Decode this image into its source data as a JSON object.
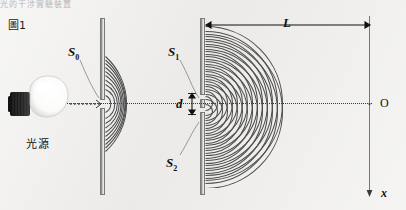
{
  "figure": {
    "label": "圖1",
    "caption_cut_top": "光的干涉實驗裝置",
    "background_color": "#edecea",
    "ink_color": "#111111",
    "wave_color": "#4d4d4d",
    "barrier_color": "#9a9a9a",
    "screen_color": "#77787a"
  },
  "light_source": {
    "label": "光源",
    "icon": "light-bulb-icon",
    "bulb_color": "#ffffff",
    "base_color": "#1e1e1e"
  },
  "slits": {
    "single": {
      "label": "S",
      "subscript": "0",
      "name": "single-slit"
    },
    "upper": {
      "label": "S",
      "subscript": "1",
      "name": "upper-slit"
    },
    "lower": {
      "label": "S",
      "subscript": "2",
      "name": "lower-slit"
    }
  },
  "dimensions": {
    "slit_separation": {
      "label": "d",
      "description": "slit separation between S1 and S2"
    },
    "screen_distance": {
      "label": "L",
      "description": "distance from double slit to screen"
    }
  },
  "screen": {
    "origin_label": "O",
    "axis_label": "x",
    "axis_direction": "down"
  },
  "waves": {
    "single_slit_arc_count": 9,
    "double_slit_arc_count": 13,
    "pattern": "circular-wavefronts"
  }
}
